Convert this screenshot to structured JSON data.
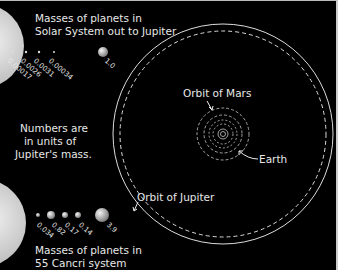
{
  "solar_system": {
    "title_line1": "Masses of planets in",
    "title_line2": "Solar System out to Jupiter",
    "masses": [
      "0.00017",
      "0.0026",
      "0.0031",
      "0.00034",
      "1.0"
    ]
  },
  "note": {
    "line1": "Numbers are",
    "line2": "in units of",
    "line3": "Jupiter's mass."
  },
  "cancri": {
    "title_line1": "Masses of planets in",
    "title_line2": "55 Cancri system",
    "masses": [
      "0.034",
      "0.82",
      "0.17",
      "0.14",
      "3.9"
    ]
  },
  "labels": {
    "orbit_mars": "Orbit of Mars",
    "earth": "Earth",
    "orbit_jupiter": "Orbit of Jupiter"
  },
  "colors": {
    "background": "#000000",
    "text": "#e8e8e8",
    "sun": "#d8d8d8"
  }
}
